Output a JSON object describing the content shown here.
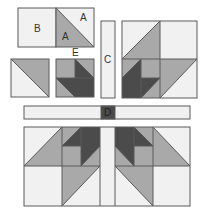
{
  "colors": {
    "light": "#f1f1f1",
    "gray": "#a9a9a9",
    "dark": "#4b4b4b",
    "stroke": "#5a5a5a",
    "background": "#ffffff"
  },
  "labels": {
    "A_top": "A",
    "A_bottom": "A",
    "B": "B",
    "C": "C",
    "D": "D",
    "E": "E"
  },
  "pieces": {
    "unit_B": {
      "name": "B square"
    },
    "unit_A": {
      "name": "A half-square triangle"
    },
    "hst_left": {
      "name": "half-square triangle unit"
    },
    "unit_E": {
      "name": "E unit"
    },
    "strip_C": {
      "name": "C sashing strip"
    },
    "block_right": {
      "name": "assembled quarter block"
    },
    "strip_D": {
      "name": "D sashing strip with center square"
    },
    "block_bottom": {
      "name": "assembled bottom half"
    }
  }
}
